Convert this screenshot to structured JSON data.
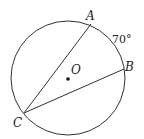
{
  "diagram": {
    "type": "circle-geometry",
    "circle": {
      "cx": 68,
      "cy": 78,
      "r": 57,
      "center_label": "O"
    },
    "points": [
      {
        "id": "A",
        "label": "A",
        "x": 91,
        "y": 24
      },
      {
        "id": "B",
        "label": "B",
        "x": 124,
        "y": 69
      },
      {
        "id": "C",
        "label": "C",
        "x": 24,
        "y": 113
      }
    ],
    "chords": [
      {
        "from": "C",
        "to": "A"
      },
      {
        "from": "C",
        "to": "B"
      }
    ],
    "arc_label": {
      "arc": "AB",
      "text": "70°"
    },
    "colors": {
      "stroke": "#333333",
      "text": "#222222",
      "background": "#ffffff"
    }
  }
}
